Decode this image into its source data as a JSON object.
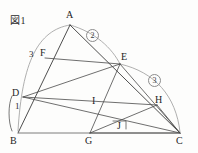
{
  "figure": {
    "caption": "図1",
    "type": "geometry-diagram",
    "canvas": {
      "width": 198,
      "height": 153
    },
    "colors": {
      "segment": "#3a3a3a",
      "arc": "#9a9a9a",
      "baseline": "#6e6e6e",
      "label": "#1e1e1e",
      "background": "#fdfdfc"
    },
    "vertices": [
      {
        "name": "A",
        "label": "A",
        "x": 70,
        "y": 25,
        "label_x": 66,
        "label_y": 12
      },
      {
        "name": "B",
        "label": "B",
        "x": 18,
        "y": 133,
        "label_x": 12,
        "label_y": 136
      },
      {
        "name": "C",
        "label": "C",
        "x": 180,
        "y": 133,
        "label_x": 177,
        "label_y": 136
      },
      {
        "name": "D",
        "label": "D",
        "x": 23,
        "y": 97,
        "label_x": 12,
        "label_y": 90
      },
      {
        "name": "E",
        "label": "E",
        "x": 120,
        "y": 64,
        "label_x": 120,
        "label_y": 55
      },
      {
        "name": "F",
        "label": "F",
        "x": 45,
        "y": 58,
        "label_x": 41,
        "label_y": 50
      },
      {
        "name": "G",
        "label": "G",
        "x": 90,
        "y": 133,
        "label_x": 86,
        "label_y": 136
      },
      {
        "name": "H",
        "label": "H",
        "x": 157,
        "y": 105,
        "label_x": 155,
        "label_y": 96
      },
      {
        "name": "I",
        "label": "I",
        "x": 95,
        "y": 107,
        "label_x": 93,
        "label_y": 98
      },
      {
        "name": "J",
        "label": "J",
        "x": 120,
        "y": 125,
        "label_x": 117,
        "label_y": 122
      }
    ],
    "segments": [
      {
        "name": "segment-A-B",
        "from": "A",
        "to": "B"
      },
      {
        "name": "segment-A-C",
        "from": "A",
        "to": "C"
      },
      {
        "name": "segment-B-C",
        "from": "B",
        "to": "C"
      },
      {
        "name": "segment-F-E",
        "from": "F",
        "to": "E"
      },
      {
        "name": "segment-D-E",
        "from": "D",
        "to": "E"
      },
      {
        "name": "segment-D-C",
        "from": "D",
        "to": "C"
      },
      {
        "name": "segment-E-G",
        "from": "E",
        "to": "G"
      },
      {
        "name": "segment-E-C",
        "from": "E",
        "to": "C"
      },
      {
        "name": "segment-G-C",
        "from": "G",
        "to": "C"
      },
      {
        "name": "segment-D-H",
        "from": "D",
        "to": "H"
      },
      {
        "name": "segment-H-C",
        "from": "H",
        "to": "C"
      },
      {
        "name": "segment-G-H",
        "from": "G",
        "to": "H"
      }
    ],
    "arcs": [
      {
        "name": "arc-A-B-left",
        "d": "M 70 25 C 38 30 22 62 18 131",
        "id": ""
      },
      {
        "name": "arc-A-E",
        "d": "M 70 25 C 95 32 112 48 120 64",
        "id": "2"
      },
      {
        "name": "arc-E-C",
        "d": "M 120 64 C 155 72 176 96 180 132",
        "id": "3"
      }
    ],
    "circled_labels": [
      {
        "name": "circled-label-2",
        "text": "②",
        "glyph": "2",
        "x": 92,
        "y": 34
      },
      {
        "name": "circled-label-3",
        "text": "③",
        "glyph": "3",
        "x": 153,
        "y": 79
      }
    ],
    "length_labels": [
      {
        "name": "length-label-3",
        "text": "3",
        "x": 30,
        "y": 54
      },
      {
        "name": "length-label-1",
        "text": "1",
        "x": 14,
        "y": 104
      }
    ],
    "tick_marks": [
      {
        "name": "bracket-B-D",
        "d": "M 12 96 C 8 104 8 122 12 131"
      },
      {
        "name": "right-angle-J",
        "d": "M 113 121 L 126 121 L 126 129"
      }
    ]
  }
}
